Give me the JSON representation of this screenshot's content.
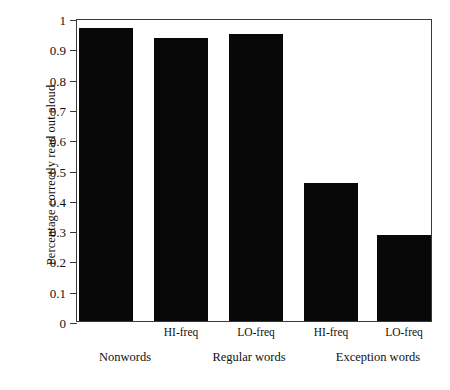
{
  "chart_data": {
    "type": "bar",
    "title": "",
    "xlabel": "",
    "ylabel": "Percentage correctly read out aloud",
    "ylim": [
      0,
      1
    ],
    "yticks": [
      "0",
      "0.1",
      "0.2",
      "0.3",
      "0.4",
      "0.5",
      "0.6",
      "0.7",
      "0.8",
      "0.9",
      "1"
    ],
    "grid": false,
    "legend": null,
    "bar_color": "#080808",
    "frame_color": "#3a3a3a",
    "categories": [
      "Nonwords",
      "HI-freq",
      "LO-freq",
      "HI-freq",
      "LO-freq"
    ],
    "values": [
      0.975,
      0.94,
      0.955,
      0.46,
      0.285
    ],
    "bars": [
      {
        "freq_label": "",
        "group": "Nonwords",
        "value": 0.975
      },
      {
        "freq_label": "HI-freq",
        "group": "Regular words",
        "value": 0.94
      },
      {
        "freq_label": "LO-freq",
        "group": "Regular words",
        "value": 0.955
      },
      {
        "freq_label": "HI-freq",
        "group": "Exception words",
        "value": 0.46
      },
      {
        "freq_label": "LO-freq",
        "group": "Exception words",
        "value": 0.285
      }
    ],
    "freq_labels": [
      "HI-freq",
      "LO-freq",
      "HI-freq",
      "LO-freq"
    ],
    "group_labels": [
      "Nonwords",
      "Regular words",
      "Exception words"
    ]
  }
}
